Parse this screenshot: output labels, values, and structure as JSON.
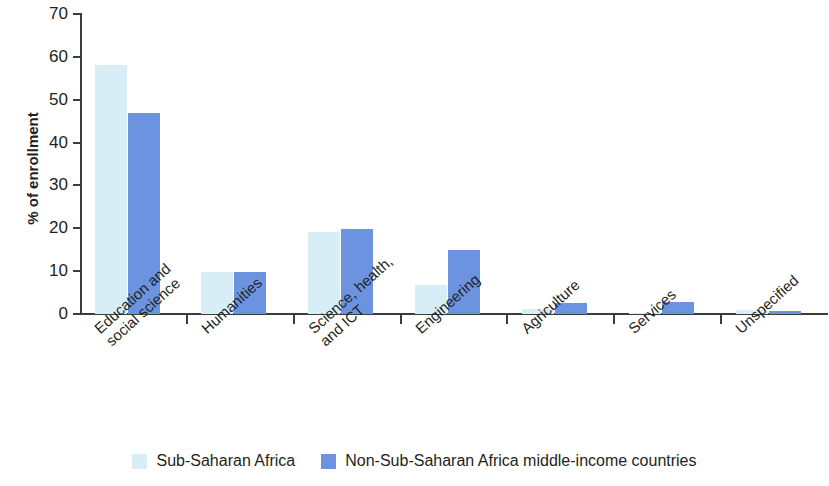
{
  "chart_data": {
    "type": "bar",
    "title": "",
    "subtitle": "",
    "xlabel": "",
    "ylabel": "% of enrollment",
    "ylim": [
      0,
      70
    ],
    "ytick_step": 10,
    "yticks": [
      "70",
      "60",
      "50",
      "40",
      "30",
      "20",
      "10",
      "0"
    ],
    "grid": false,
    "legend_position": "bottom-center",
    "categories": [
      "Education and social science",
      "Humanities",
      "Science, health, and ICT",
      "Engineering",
      "Agriculture",
      "Services",
      "Unspecified"
    ],
    "category_lines": [
      [
        "Education and",
        "social science"
      ],
      [
        "Humanities",
        ""
      ],
      [
        "Science, health,",
        "and ICT"
      ],
      [
        "Engineering",
        ""
      ],
      [
        "Agriculture",
        ""
      ],
      [
        "Services",
        ""
      ],
      [
        "Unspecified",
        ""
      ]
    ],
    "series": [
      {
        "name": "Sub-Saharan Africa",
        "color": "#d8eef6",
        "values": [
          58.0,
          9.9,
          19.1,
          6.7,
          1.2,
          0.2,
          1.0
        ]
      },
      {
        "name": "Non-Sub-Saharan Africa middle-income countries",
        "color": "#6b93e0",
        "values": [
          46.8,
          9.9,
          19.9,
          14.9,
          2.6,
          2.8,
          0.8
        ]
      }
    ]
  },
  "legend": {
    "items": [
      {
        "label": "Sub-Saharan Africa",
        "swatch": "light"
      },
      {
        "label": "Non-Sub-Saharan Africa middle-income countries",
        "swatch": "dark"
      }
    ]
  },
  "colors": {
    "series_light": "#d8eef6",
    "series_dark": "#6b93e0",
    "axis": "#3c3c3c",
    "text": "#231f20",
    "background": "#ffffff"
  }
}
